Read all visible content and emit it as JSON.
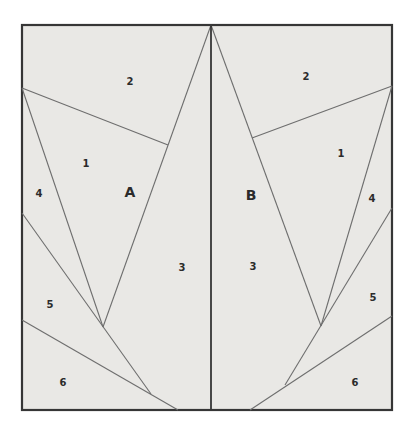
{
  "diagram": {
    "colors": {
      "page_background": "#ffffff",
      "panel_fill": "#e9e8e5",
      "border": "#363636",
      "seam_line": "#6e6e6e",
      "label": "#2b2b2b"
    },
    "frame": {
      "x": 22,
      "y": 25,
      "width": 370,
      "height": 385
    },
    "center_line": {
      "x1": 211,
      "y1": 25,
      "x2": 211,
      "y2": 410
    },
    "seam_lines": [
      {
        "name": "left-apex-line",
        "x1": 211,
        "y1": 25,
        "x2": 103,
        "y2": 327
      },
      {
        "name": "left-1-2-boundary",
        "x1": 22,
        "y1": 88,
        "x2": 168,
        "y2": 145
      },
      {
        "name": "left-4-1-boundary",
        "x1": 22,
        "y1": 88,
        "x2": 103,
        "y2": 327
      },
      {
        "name": "left-4-5-boundary",
        "x1": 22,
        "y1": 213,
        "x2": 151,
        "y2": 394
      },
      {
        "name": "left-5-6-boundary",
        "x1": 22,
        "y1": 320,
        "x2": 178,
        "y2": 410
      },
      {
        "name": "right-apex-line",
        "x1": 211,
        "y1": 25,
        "x2": 321,
        "y2": 326
      },
      {
        "name": "right-1-2-boundary",
        "x1": 392,
        "y1": 86,
        "x2": 252,
        "y2": 138
      },
      {
        "name": "right-4-1-boundary",
        "x1": 392,
        "y1": 86,
        "x2": 321,
        "y2": 326
      },
      {
        "name": "right-4-5-boundary",
        "x1": 392,
        "y1": 208,
        "x2": 285,
        "y2": 385
      },
      {
        "name": "right-5-6-boundary",
        "x1": 392,
        "y1": 316,
        "x2": 250,
        "y2": 410
      }
    ],
    "piece_labels": [
      {
        "text": "2",
        "x": 130,
        "y": 81
      },
      {
        "text": "1",
        "x": 86,
        "y": 163
      },
      {
        "text": "4",
        "x": 39,
        "y": 193
      },
      {
        "text": "3",
        "x": 182,
        "y": 267
      },
      {
        "text": "5",
        "x": 50,
        "y": 304
      },
      {
        "text": "6",
        "x": 63,
        "y": 382
      },
      {
        "text": "2",
        "x": 306,
        "y": 76
      },
      {
        "text": "1",
        "x": 341,
        "y": 153
      },
      {
        "text": "4",
        "x": 372,
        "y": 198
      },
      {
        "text": "3",
        "x": 253,
        "y": 266
      },
      {
        "text": "5",
        "x": 373,
        "y": 297
      },
      {
        "text": "6",
        "x": 355,
        "y": 382
      }
    ],
    "section_labels": [
      {
        "text": "A",
        "x": 130,
        "y": 192
      },
      {
        "text": "B",
        "x": 251,
        "y": 195
      }
    ]
  }
}
